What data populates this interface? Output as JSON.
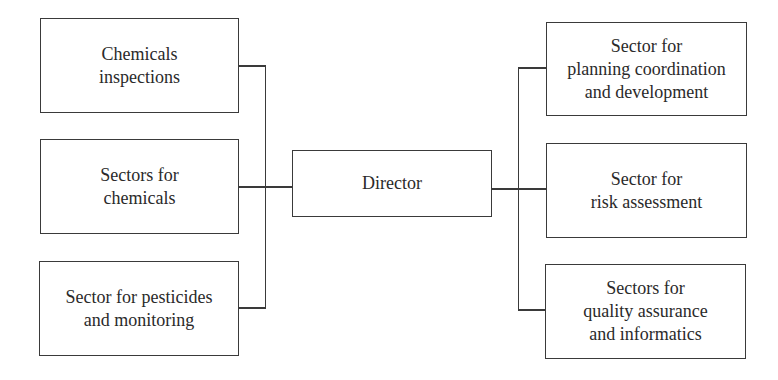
{
  "diagram": {
    "type": "org-chart",
    "center": {
      "id": "director",
      "label": "Director"
    },
    "left_units": [
      {
        "id": "chemicals-inspections",
        "label": "Chemicals\ninspections"
      },
      {
        "id": "sectors-for-chemicals",
        "label": "Sectors for\nchemicals"
      },
      {
        "id": "sector-pesticides-monitoring",
        "label": "Sector for pesticides\nand monitoring"
      }
    ],
    "right_units": [
      {
        "id": "sector-planning-coordination-development",
        "label": "Sector for\nplanning coordination\nand development"
      },
      {
        "id": "sector-risk-assessment",
        "label": "Sector for\nrisk assessment"
      },
      {
        "id": "sectors-quality-assurance-informatics",
        "label": "Sectors for\nquality assurance\nand informatics"
      }
    ],
    "edges": [
      {
        "from": "director",
        "to": "chemicals-inspections"
      },
      {
        "from": "director",
        "to": "sectors-for-chemicals"
      },
      {
        "from": "director",
        "to": "sector-pesticides-monitoring"
      },
      {
        "from": "director",
        "to": "sector-planning-coordination-development"
      },
      {
        "from": "director",
        "to": "sector-risk-assessment"
      },
      {
        "from": "director",
        "to": "sectors-quality-assurance-informatics"
      }
    ],
    "colors": {
      "stroke": "#3a3a3a",
      "text": "#2a2a2a",
      "background": "#ffffff"
    }
  }
}
